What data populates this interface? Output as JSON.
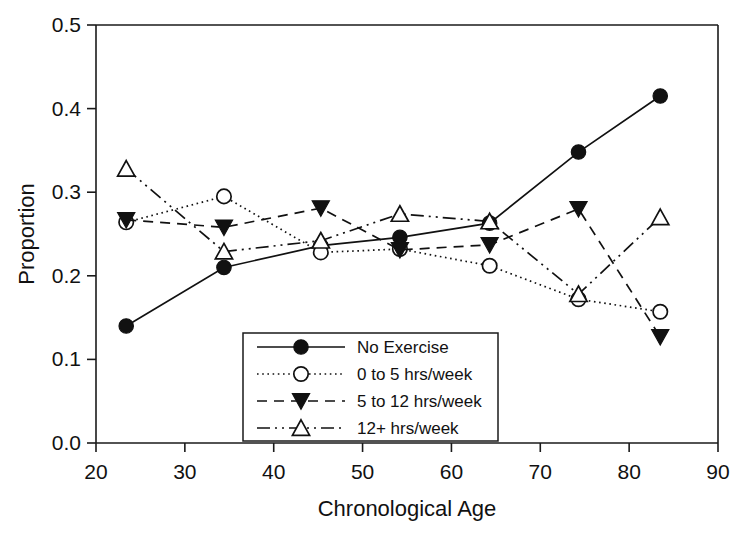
{
  "chart_data": {
    "type": "line",
    "title": "",
    "xlabel": "Chronological Age",
    "ylabel": "Proportion",
    "xlim": [
      20,
      90
    ],
    "ylim": [
      0.0,
      0.5
    ],
    "xticks": [
      "20",
      "30",
      "40",
      "50",
      "60",
      "70",
      "80",
      "90"
    ],
    "xtick_values": [
      20,
      30,
      40,
      50,
      60,
      70,
      80,
      90
    ],
    "yticks": [
      "0.0",
      "0.1",
      "0.2",
      "0.3",
      "0.4",
      "0.5"
    ],
    "ytick_values": [
      0.0,
      0.1,
      0.2,
      0.3,
      0.4,
      0.5
    ],
    "grid": false,
    "legend_position": "lower-center",
    "x": [
      23.4,
      34.4,
      45.3,
      54.2,
      64.3,
      74.3,
      83.5
    ],
    "series": [
      {
        "name": "No Exercise",
        "marker": "filled-circle",
        "linestyle": "solid",
        "color": "#111111",
        "values": [
          0.14,
          0.21,
          0.236,
          0.246,
          0.263,
          0.348,
          0.415
        ]
      },
      {
        "name": "0 to 5 hrs/week",
        "marker": "open-circle",
        "linestyle": "dotted",
        "color": "#111111",
        "values": [
          0.264,
          0.295,
          0.228,
          0.232,
          0.212,
          0.172,
          0.157
        ]
      },
      {
        "name": "5 to 12 hrs/week",
        "marker": "filled-triangle-down",
        "linestyle": "dashed",
        "color": "#111111",
        "values": [
          0.267,
          0.258,
          0.281,
          0.231,
          0.237,
          0.28,
          0.127
        ]
      },
      {
        "name": "12+ hrs/week",
        "marker": "open-triangle-up",
        "linestyle": "dash-dot-dot",
        "color": "#111111",
        "values": [
          0.328,
          0.229,
          0.242,
          0.274,
          0.265,
          0.178,
          0.27
        ]
      }
    ]
  },
  "figure": {
    "background": "#ffffff",
    "foreground": "#111111"
  }
}
